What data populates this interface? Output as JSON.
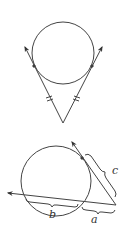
{
  "figures": [
    {
      "id": "tangent-tangent",
      "description": "Two tangent segments from an external point to a circle are congruent",
      "circle": {
        "cx": 63,
        "cy": 53,
        "r": 31
      },
      "vertex": [
        63,
        123
      ],
      "tangent_points": [
        [
          34,
          66
        ],
        [
          92,
          66
        ]
      ],
      "arrow_tips": [
        [
          25,
          47
        ],
        [
          102,
          47
        ]
      ],
      "tick_marks": "double"
    },
    {
      "id": "tangent-secant",
      "description": "Tangent-secant relationship",
      "circle": {
        "cx": 56,
        "cy": 181,
        "r": 35
      },
      "external_point": [
        116,
        205
      ],
      "tangent_point": [
        82,
        158
      ],
      "tangent_arrow_tip": [
        72,
        142
      ],
      "secant_arrow_tip": [
        8,
        193
      ],
      "labels": {
        "a": "a",
        "b": "b",
        "c": "c"
      }
    }
  ],
  "stroke_color": "#444444"
}
